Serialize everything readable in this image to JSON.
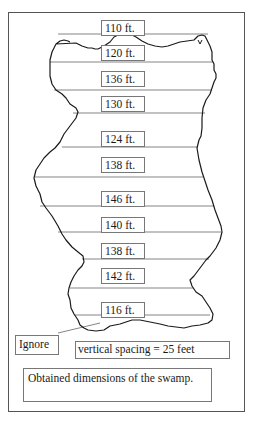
{
  "diagram": {
    "type": "swamp-dimension-sketch",
    "measurements": [
      {
        "label": "110 ft.",
        "value": 110,
        "unit": "ft"
      },
      {
        "label": "120 ft.",
        "value": 120,
        "unit": "ft"
      },
      {
        "label": "136 ft.",
        "value": 136,
        "unit": "ft"
      },
      {
        "label": "130 ft.",
        "value": 130,
        "unit": "ft"
      },
      {
        "label": "124 ft.",
        "value": 124,
        "unit": "ft"
      },
      {
        "label": "138 ft.",
        "value": 138,
        "unit": "ft"
      },
      {
        "label": "146 ft.",
        "value": 146,
        "unit": "ft"
      },
      {
        "label": "140 ft.",
        "value": 140,
        "unit": "ft"
      },
      {
        "label": "138 ft.",
        "value": 138,
        "unit": "ft"
      },
      {
        "label": "142 ft.",
        "value": 142,
        "unit": "ft"
      },
      {
        "label": "116 ft.",
        "value": 116,
        "unit": "ft"
      }
    ],
    "ignore_label": "Ignore",
    "spacing_note": "vertical spacing  = 25 feet",
    "caption": "Obtained dimensions of the swamp.",
    "colors": {
      "outline": "#1a1a1a",
      "lines": "#666666",
      "box_border": "#777777"
    }
  }
}
